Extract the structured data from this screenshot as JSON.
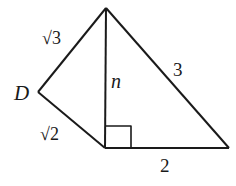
{
  "diagram": {
    "type": "geometry",
    "labels": {
      "vertex_d": "D",
      "side_top_left": "√3",
      "side_bottom_left": "√2",
      "side_vertical": "n",
      "side_hypotenuse": "3",
      "side_base": "2"
    },
    "right_angle_marker": true,
    "colors": {
      "stroke": "#1a1a1a",
      "background": "#ffffff"
    }
  }
}
